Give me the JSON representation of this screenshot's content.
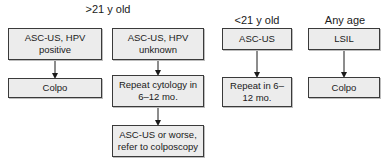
{
  "headers": {
    "over21": ">21 y old",
    "under21": "<21 y old",
    "any_age": "Any age"
  },
  "columns": [
    {
      "group": ">21 y old",
      "boxes": [
        "ASC-US, HPV positive",
        "Colpo"
      ]
    },
    {
      "group": ">21 y old",
      "boxes": [
        "ASC-US, HPV unknown",
        "Repeat cytology in 6–12 mo.",
        "ASC-US or worse, refer to colposcopy"
      ]
    },
    {
      "group": "<21 y old",
      "boxes": [
        "ASC-US",
        "Repeat in 6–12 mo."
      ]
    },
    {
      "group": "Any age",
      "boxes": [
        "LSIL",
        "Colpo"
      ]
    }
  ],
  "colors": {
    "box_fill": "#ececec",
    "box_border": "#3a3a3a",
    "arrow": "#1a1a1a"
  }
}
